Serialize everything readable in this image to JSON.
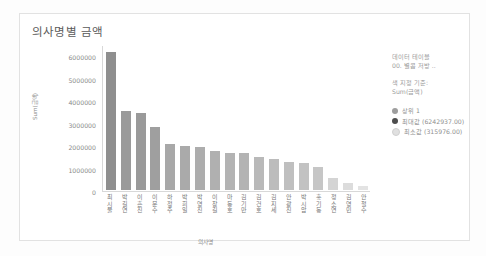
{
  "card": {
    "title": "의사명별 금액"
  },
  "side_panel": {
    "lines": [
      "데이터 테이블",
      "00. 별콤 저방 .."
    ],
    "basis_lines": [
      "색 지정 기준:",
      "Sum(금액)"
    ],
    "legend": [
      {
        "label": "상위 1",
        "color": "#9e9e9e"
      },
      {
        "label": "최대값 (6242937.00)",
        "color": "#4d4d4d"
      },
      {
        "label": "최소값 (315976.00)",
        "color": "#e0e0e0"
      }
    ]
  },
  "chart_data": {
    "type": "bar",
    "title": "의사명별 금액",
    "xlabel": "의사명",
    "ylabel": "Sum(금액)",
    "ylim": [
      0,
      6500000
    ],
    "yticks": [
      6000000,
      5000000,
      4000000,
      3000000,
      2000000,
      1000000,
      0
    ],
    "ytick_labels": [
      "6000000",
      "5000000",
      "4000000",
      "3000000",
      "2000000",
      "1000000",
      "0"
    ],
    "grid": false,
    "legend_position": "right",
    "categories": [
      "최시물",
      "박길연",
      "이흔진",
      "이문수",
      "하정주",
      "박희일",
      "박영진",
      "이창길",
      "마동호",
      "김기만",
      "김건호",
      "김지세",
      "안광진",
      "박시암",
      "홍기동",
      "정소연",
      "김영민",
      "안철수"
    ],
    "values": [
      6242937,
      3560000,
      3480000,
      2860000,
      2060000,
      2000000,
      1920000,
      1760000,
      1680000,
      1680000,
      1480000,
      1380000,
      1280000,
      1220000,
      1060000,
      520000,
      315976,
      180000
    ],
    "colors": [
      "#8f8f8f",
      "#9a9a9a",
      "#9a9a9a",
      "#9f9f9f",
      "#a8a8a8",
      "#aaaaaa",
      "#adadad",
      "#b0b0b0",
      "#b3b3b3",
      "#b3b3b3",
      "#b9b9b9",
      "#bcbcbc",
      "#bfbfbf",
      "#c2c2c2",
      "#c6c6c6",
      "#d4d4d4",
      "#dcdcdc",
      "#e3e3e3"
    ],
    "series_max_label": "최대값 (6242937.00)",
    "series_min_label": "최소값 (315976.00)"
  }
}
